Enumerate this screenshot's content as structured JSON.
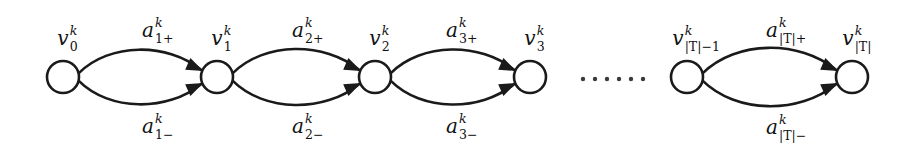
{
  "figure": {
    "type": "directed-multigraph-chain",
    "background_color": "#ffffff",
    "stroke_color": "#1a1a1a",
    "width": 903,
    "height": 154
  },
  "nodes": [
    {
      "id": "v0",
      "cx": 63,
      "cy": 77,
      "r": 16,
      "label_base": "v",
      "label_sup": "k",
      "label_sub": "0",
      "label_x": 63,
      "label_y": 38
    },
    {
      "id": "v1",
      "cx": 217,
      "cy": 77,
      "r": 16,
      "label_base": "v",
      "label_sup": "k",
      "label_sub": "1",
      "label_x": 217,
      "label_y": 38
    },
    {
      "id": "v2",
      "cx": 375,
      "cy": 77,
      "r": 16,
      "label_base": "v",
      "label_sup": "k",
      "label_sub": "2",
      "label_x": 375,
      "label_y": 38
    },
    {
      "id": "v3",
      "cx": 530,
      "cy": 77,
      "r": 16,
      "label_base": "v",
      "label_sup": "k",
      "label_sub": "3",
      "label_x": 530,
      "label_y": 38
    },
    {
      "id": "vT-1",
      "cx": 687,
      "cy": 77,
      "r": 16,
      "label_base": "v",
      "label_sup": "k",
      "label_sub": "|T|−1",
      "label_x": 678,
      "label_y": 38
    },
    {
      "id": "vT",
      "cx": 852,
      "cy": 77,
      "r": 16,
      "label_base": "v",
      "label_sup": "k",
      "label_sub": "|T|",
      "label_x": 848,
      "label_y": 38
    }
  ],
  "edges": [
    {
      "id": "a1p",
      "from": "v0",
      "to": "v1",
      "direction": "upper",
      "label_base": "a",
      "label_sup": "k",
      "label_sub": "1+",
      "label_x": 148,
      "label_y": 30
    },
    {
      "id": "a1m",
      "from": "v0",
      "to": "v1",
      "direction": "lower",
      "label_base": "a",
      "label_sup": "k",
      "label_sub": "1−",
      "label_x": 148,
      "label_y": 126
    },
    {
      "id": "a2p",
      "from": "v1",
      "to": "v2",
      "direction": "upper",
      "label_base": "a",
      "label_sup": "k",
      "label_sub": "2+",
      "label_x": 298,
      "label_y": 30
    },
    {
      "id": "a2m",
      "from": "v1",
      "to": "v2",
      "direction": "lower",
      "label_base": "a",
      "label_sup": "k",
      "label_sub": "2−",
      "label_x": 298,
      "label_y": 126
    },
    {
      "id": "a3p",
      "from": "v2",
      "to": "v3",
      "direction": "upper",
      "label_base": "a",
      "label_sup": "k",
      "label_sub": "3+",
      "label_x": 452,
      "label_y": 30
    },
    {
      "id": "a3m",
      "from": "v2",
      "to": "v3",
      "direction": "lower",
      "label_base": "a",
      "label_sup": "k",
      "label_sub": "3−",
      "label_x": 452,
      "label_y": 126
    },
    {
      "id": "aTp",
      "from": "vT-1",
      "to": "vT",
      "direction": "upper",
      "label_base": "a",
      "label_sup": "k",
      "label_sub": "|T|+",
      "label_x": 772,
      "label_y": 30
    },
    {
      "id": "aTm",
      "from": "vT-1",
      "to": "vT",
      "direction": "lower",
      "label_base": "a",
      "label_sup": "k",
      "label_sub": "|T|−",
      "label_x": 772,
      "label_y": 127
    }
  ],
  "ellipsis": {
    "dot_count": 6,
    "x_start": 583,
    "x_step": 12,
    "y": 79,
    "radius": 2.2
  }
}
